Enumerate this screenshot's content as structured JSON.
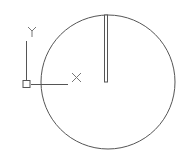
{
  "drawing": {
    "background": "#ffffff",
    "stroke_color": "#555555",
    "ucs_icon": {
      "x_label": "X",
      "y_label": "Y",
      "origin": [
        27,
        84
      ]
    },
    "circle": {
      "cx": 108,
      "cy": 82,
      "r": 67
    },
    "slot": {
      "x": 104,
      "y": 15,
      "width": 4,
      "height": 67
    }
  }
}
